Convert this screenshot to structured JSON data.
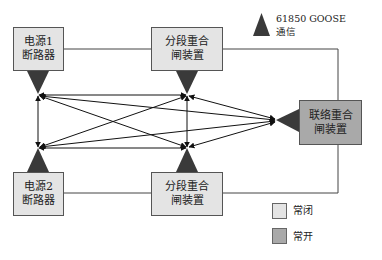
{
  "diagram": {
    "nodes": [
      {
        "id": "source1",
        "line1": "电源1",
        "line2": "断路器",
        "state": "normally_closed"
      },
      {
        "id": "section_top",
        "line1": "分段重合",
        "line2": "闸装置",
        "state": "normally_closed"
      },
      {
        "id": "source2",
        "line1": "电源2",
        "line2": "断路器",
        "state": "normally_closed"
      },
      {
        "id": "section_bottom",
        "line1": "分段重合",
        "line2": "闸装置",
        "state": "normally_closed"
      },
      {
        "id": "tie",
        "line1": "联络重合",
        "line2": "闸装置",
        "state": "normally_open"
      }
    ],
    "power_lines": [
      [
        "source1",
        "section_top"
      ],
      [
        "section_top",
        "tie"
      ],
      [
        "source2",
        "section_bottom"
      ],
      [
        "section_bottom",
        "tie"
      ]
    ],
    "goose_links": [
      [
        "source1",
        "section_top"
      ],
      [
        "source1",
        "source2"
      ],
      [
        "source1",
        "section_bottom"
      ],
      [
        "source1",
        "tie"
      ],
      [
        "section_top",
        "source2"
      ],
      [
        "section_top",
        "section_bottom"
      ],
      [
        "section_top",
        "tie"
      ],
      [
        "source2",
        "section_bottom"
      ],
      [
        "source2",
        "tie"
      ],
      [
        "section_bottom",
        "tie"
      ]
    ]
  },
  "legend": {
    "goose_line1": "61850 GOOSE",
    "goose_line2": "通信",
    "closed_label": "常闭",
    "open_label": "常开",
    "colors": {
      "closed": "#e4e4e4",
      "open": "#a9a9a9",
      "triangle": "#3a3a3a"
    }
  }
}
